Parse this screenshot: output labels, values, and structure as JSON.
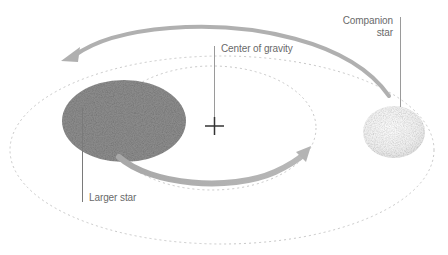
{
  "diagram": {
    "labels": {
      "center_of_gravity": "Center of gravity",
      "larger_star": "Larger star",
      "companion_star": "Companion star"
    },
    "colors": {
      "background": "#ffffff",
      "larger_star_fill": "#8a8a8a",
      "companion_star_fill": "#f2f2f2",
      "arrow": "#b0b0b0",
      "orbit_dash": "#c8c8c8",
      "leader_line": "#9a9a9a",
      "cross": "#333333",
      "label_text": "#6a6a6a"
    },
    "elements": [
      "larger-star",
      "companion-star",
      "center-of-gravity-cross",
      "inner-orbit",
      "outer-orbit",
      "orbit-arrow-upper",
      "orbit-arrow-lower"
    ]
  }
}
